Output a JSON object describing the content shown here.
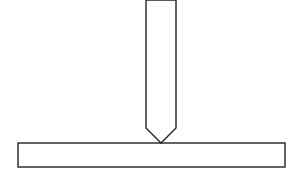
{
  "diagram": {
    "type": "line-drawing",
    "background": "#ffffff",
    "stroke_color": "#222222",
    "stroke_width": 1.4,
    "shapes": {
      "rod": {
        "description": "vertical rod with pointed (beveled) tip",
        "left_x": 146,
        "right_x": 176,
        "top_y": 0,
        "bevel_start_y": 128,
        "tip_x": 161,
        "tip_y": 143
      },
      "plate": {
        "description": "horizontal flat plate / base bar",
        "x": 18,
        "y": 143,
        "width": 267,
        "height": 24
      }
    },
    "contact_point": {
      "x": 161,
      "y": 143
    }
  }
}
